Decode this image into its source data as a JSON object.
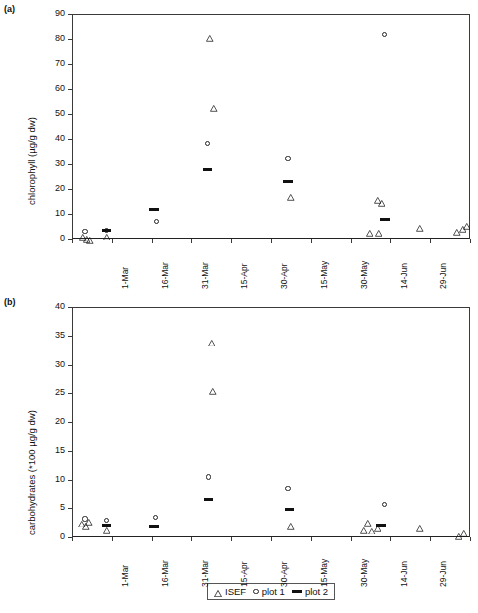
{
  "figure": {
    "panel_a_label": "(a)",
    "panel_b_label": "(b)"
  },
  "legend": {
    "items": [
      {
        "symbol": "triangle",
        "label": "ISEF"
      },
      {
        "symbol": "circle",
        "label": "plot 1"
      },
      {
        "symbol": "bar",
        "label": "plot 2"
      }
    ]
  },
  "chart_data": [
    {
      "type": "scatter",
      "panel": "(a)",
      "title": "",
      "xlabel": "",
      "ylabel": "chlorophyll (µg/g dw)",
      "ylim": [
        0,
        90
      ],
      "yticks": [
        0,
        10,
        20,
        30,
        40,
        50,
        60,
        70,
        80,
        90
      ],
      "ytick_labels": [
        "0",
        "10",
        "20",
        "30",
        "40",
        "50",
        "60",
        "70",
        "80",
        "90"
      ],
      "xticks": [
        0,
        15,
        30,
        45,
        60,
        75,
        90,
        105,
        120,
        135,
        150
      ],
      "xtick_labels": [
        "1-Mar",
        "16-Mar",
        "31-Mar",
        "15-Apr",
        "30-Apr",
        "15-May",
        "30-May",
        "14-Jun",
        "29-Jun",
        "14-Jul",
        "29-Jul"
      ],
      "xlim": [
        0,
        150
      ],
      "grid": false,
      "legend_position": "below-panel-b",
      "series": [
        {
          "name": "ISEF",
          "symbol": "triangle",
          "points": [
            {
              "x": 4.0,
              "y": 3.4
            },
            {
              "x": 5.4,
              "y": 2.6
            },
            {
              "x": 6.6,
              "y": 2.2
            },
            {
              "x": 13.0,
              "y": 3.5
            },
            {
              "x": 52.0,
              "y": 82.8
            },
            {
              "x": 53.5,
              "y": 55.0
            },
            {
              "x": 82.5,
              "y": 19.4
            },
            {
              "x": 115.0,
              "y": 18.2
            },
            {
              "x": 116.5,
              "y": 16.8
            },
            {
              "x": 112.0,
              "y": 5.0
            },
            {
              "x": 115.5,
              "y": 4.8
            },
            {
              "x": 131.0,
              "y": 7.0
            },
            {
              "x": 145.0,
              "y": 5.4
            },
            {
              "x": 147.0,
              "y": 6.6
            },
            {
              "x": 148.5,
              "y": 7.6
            }
          ]
        },
        {
          "name": "plot 1",
          "symbol": "circle",
          "points": [
            {
              "x": 5.0,
              "y": 3.0
            },
            {
              "x": 13.2,
              "y": 3.4
            },
            {
              "x": 32.0,
              "y": 7.0
            },
            {
              "x": 51.0,
              "y": 38.0
            },
            {
              "x": 81.5,
              "y": 32.0
            },
            {
              "x": 118.0,
              "y": 81.8
            }
          ]
        },
        {
          "name": "plot 2",
          "symbol": "bar",
          "points": [
            {
              "x": 13.0,
              "y": 3.4
            },
            {
              "x": 31.0,
              "y": 12.0
            },
            {
              "x": 51.0,
              "y": 28.0
            },
            {
              "x": 81.5,
              "y": 23.0
            },
            {
              "x": 118.0,
              "y": 8.0
            }
          ]
        }
      ]
    },
    {
      "type": "scatter",
      "panel": "(b)",
      "title": "",
      "xlabel": "",
      "ylabel": "carbohydrates (*100 µg/g dw)",
      "ylim": [
        0,
        40
      ],
      "yticks": [
        0,
        5,
        10,
        15,
        20,
        25,
        30,
        35,
        40
      ],
      "ytick_labels": [
        "0",
        "5",
        "10",
        "15",
        "20",
        "25",
        "30",
        "35",
        "40"
      ],
      "xticks": [
        0,
        15,
        30,
        45,
        60,
        75,
        90,
        105,
        120,
        135,
        150
      ],
      "xtick_labels": [
        "1-Mar",
        "16-Mar",
        "31-Mar",
        "15-Apr",
        "30-Apr",
        "15-May",
        "30-May",
        "14-Jun",
        "29-Jun",
        "14-Jul",
        "29-Jul"
      ],
      "xlim": [
        0,
        150
      ],
      "grid": false,
      "legend_position": "bottom-center",
      "series": [
        {
          "name": "ISEF",
          "symbol": "triangle",
          "points": [
            {
              "x": 3.6,
              "y": 3.4
            },
            {
              "x": 5.2,
              "y": 3.0
            },
            {
              "x": 6.4,
              "y": 3.7
            },
            {
              "x": 13.0,
              "y": 2.3
            },
            {
              "x": 52.5,
              "y": 34.9
            },
            {
              "x": 53.0,
              "y": 26.4
            },
            {
              "x": 82.5,
              "y": 3.0
            },
            {
              "x": 111.5,
              "y": 3.5
            },
            {
              "x": 110.0,
              "y": 2.3
            },
            {
              "x": 113.0,
              "y": 2.2
            },
            {
              "x": 115.0,
              "y": 2.6
            },
            {
              "x": 131.0,
              "y": 2.6
            },
            {
              "x": 145.5,
              "y": 1.2
            },
            {
              "x": 147.5,
              "y": 1.7
            }
          ]
        },
        {
          "name": "plot 1",
          "symbol": "circle",
          "points": [
            {
              "x": 5.0,
              "y": 3.1
            },
            {
              "x": 13.2,
              "y": 2.8
            },
            {
              "x": 31.5,
              "y": 3.4
            },
            {
              "x": 51.5,
              "y": 10.4
            },
            {
              "x": 81.5,
              "y": 8.4
            },
            {
              "x": 118.0,
              "y": 5.6
            }
          ]
        },
        {
          "name": "plot 2",
          "symbol": "bar",
          "points": [
            {
              "x": 13.0,
              "y": 2.0
            },
            {
              "x": 31.0,
              "y": 1.9
            },
            {
              "x": 51.5,
              "y": 6.5
            },
            {
              "x": 82.0,
              "y": 4.7
            },
            {
              "x": 116.5,
              "y": 2.0
            }
          ]
        }
      ]
    }
  ]
}
